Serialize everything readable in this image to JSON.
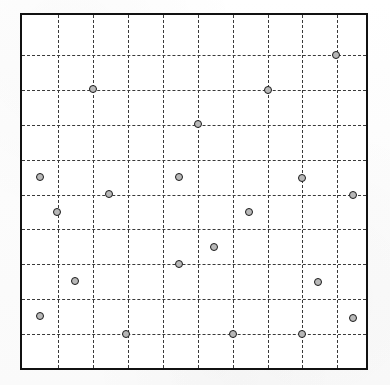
{
  "figure": {
    "title": "",
    "subtitle": "",
    "caption": ""
  },
  "chart_data": {
    "type": "scatter",
    "title": "",
    "xlabel": "",
    "ylabel": "",
    "xlim": [
      0,
      10
    ],
    "ylim": [
      0,
      10
    ],
    "grid": true,
    "grid_style": "dashed",
    "grid_color": "#3a3a3a",
    "legend": "none",
    "xticklabels": [],
    "yticklabels": [],
    "x_gridlines": [
      1,
      2,
      3,
      4,
      5,
      6,
      7,
      8,
      9
    ],
    "y_gridlines": [
      1,
      2,
      3,
      4,
      5,
      6,
      7,
      8,
      9
    ],
    "marker": {
      "shape": "circle",
      "facecolor": "#b8b8b8",
      "edgecolor": "#1a1a1a",
      "size_px": 8
    },
    "border_color": "#111111",
    "n_points": 22,
    "series": [
      {
        "name": "points",
        "points": [
          {
            "x": 9.0,
            "y": 8.9
          },
          {
            "x": 2.0,
            "y": 7.9
          },
          {
            "x": 7.0,
            "y": 7.9
          },
          {
            "x": 5.0,
            "y": 6.9
          },
          {
            "x": 0.5,
            "y": 5.5
          },
          {
            "x": 4.5,
            "y": 5.5
          },
          {
            "x": 8.0,
            "y": 5.5
          },
          {
            "x": 2.5,
            "y": 5.0
          },
          {
            "x": 10.0,
            "y": 5.0
          },
          {
            "x": 1.0,
            "y": 4.5
          },
          {
            "x": 6.0,
            "y": 4.5
          },
          {
            "x": 5.5,
            "y": 3.5
          },
          {
            "x": 4.5,
            "y": 3.0
          },
          {
            "x": 1.5,
            "y": 2.5
          },
          {
            "x": 8.5,
            "y": 2.5
          },
          {
            "x": 0.5,
            "y": 1.5
          },
          {
            "x": 9.5,
            "y": 1.5
          },
          {
            "x": 3.0,
            "y": 1.0
          },
          {
            "x": 6.0,
            "y": 1.0
          },
          {
            "x": 8.0,
            "y": 1.0
          }
        ]
      }
    ],
    "points_px": [
      {
        "x": 334,
        "y": 53
      },
      {
        "x": 91,
        "y": 87
      },
      {
        "x": 266,
        "y": 88
      },
      {
        "x": 196,
        "y": 122
      },
      {
        "x": 38,
        "y": 175
      },
      {
        "x": 177,
        "y": 175
      },
      {
        "x": 300,
        "y": 176
      },
      {
        "x": 107,
        "y": 192
      },
      {
        "x": 351,
        "y": 193
      },
      {
        "x": 55,
        "y": 210
      },
      {
        "x": 247,
        "y": 210
      },
      {
        "x": 212,
        "y": 245
      },
      {
        "x": 177,
        "y": 262
      },
      {
        "x": 73,
        "y": 279
      },
      {
        "x": 316,
        "y": 280
      },
      {
        "x": 38,
        "y": 314
      },
      {
        "x": 351,
        "y": 316
      },
      {
        "x": 124,
        "y": 332
      },
      {
        "x": 231,
        "y": 332
      },
      {
        "x": 300,
        "y": 332
      }
    ],
    "geometry": {
      "frame_left_px": 20,
      "frame_top_px": 13,
      "frame_width_px": 348,
      "frame_height_px": 357,
      "gridline_x_px": [
        56,
        91,
        126,
        161,
        196,
        231,
        266,
        300,
        335
      ],
      "gridline_y_px": [
        53,
        88,
        123,
        158,
        193,
        227,
        262,
        297,
        332
      ]
    }
  }
}
